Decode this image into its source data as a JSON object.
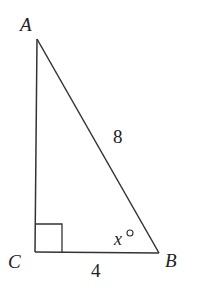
{
  "diagram": {
    "type": "right-triangle",
    "vertices": {
      "A": {
        "label": "A",
        "x": 37,
        "y": 39
      },
      "C": {
        "label": "C",
        "x": 35,
        "y": 252
      },
      "B": {
        "label": "B",
        "x": 159,
        "y": 253
      }
    },
    "side_labels": {
      "hypotenuse_AB": "8",
      "leg_CB": "4"
    },
    "angle_label": {
      "vertex": "B",
      "variable": "x",
      "unit": "°"
    },
    "right_angle_at": "C",
    "stroke_color": "#333333"
  }
}
